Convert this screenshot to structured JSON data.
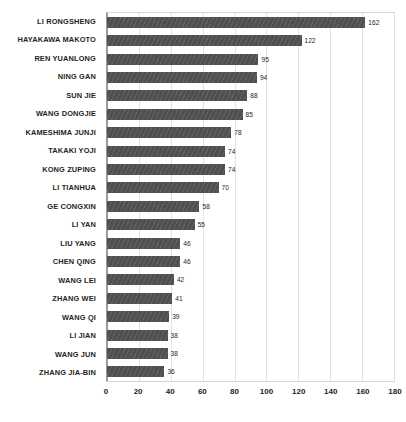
{
  "chart_data": {
    "type": "bar",
    "orientation": "horizontal",
    "title": "",
    "subtitle": "",
    "xlabel": "",
    "ylabel": "",
    "xlim": [
      0,
      180
    ],
    "xticks": [
      0,
      20,
      40,
      60,
      80,
      100,
      120,
      140,
      160,
      180
    ],
    "grid": true,
    "legend": false,
    "bar_color": "#4f4f4f",
    "categories": [
      "LI RONGSHENG",
      "HAYAKAWA MAKOTO",
      "REN YUANLONG",
      "NING GAN",
      "SUN JIE",
      "WANG DONGJIE",
      "KAMESHIMA JUNJI",
      "TAKAKI YOJI",
      "KONG ZUPING",
      "LI TIANHUA",
      "GE CONGXIN",
      "LI YAN",
      "LIU YANG",
      "CHEN QING",
      "WANG LEI",
      "ZHANG WEI",
      "WANG QI",
      "LI JIAN",
      "WANG JUN",
      "ZHANG JIA-BIN"
    ],
    "values": [
      162,
      122,
      95,
      94,
      88,
      85,
      78,
      74,
      74,
      70,
      58,
      55,
      46,
      46,
      42,
      41,
      39,
      38,
      38,
      36
    ]
  }
}
